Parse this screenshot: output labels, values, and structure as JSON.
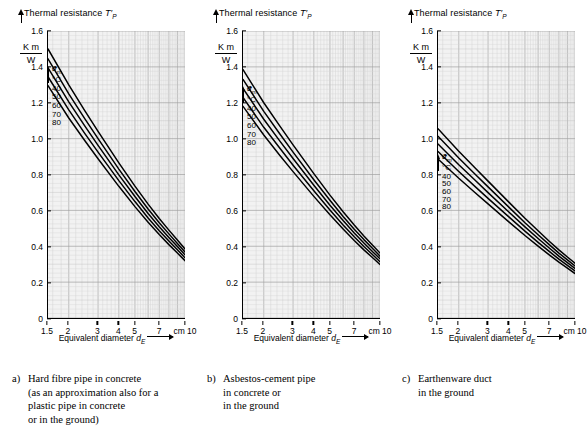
{
  "figure": {
    "axis_title": "Thermal resistance",
    "axis_symbol": "T",
    "axis_symbol_prime": "′",
    "axis_symbol_sub": "P",
    "y_unit_num": "K m",
    "y_unit_den": "W",
    "x_axis_title": "Equivalent diameter",
    "x_axis_symbol": "d",
    "x_axis_symbol_sub": "E",
    "legend_symbol": "ϑ",
    "legend_symbol_sub": "m",
    "legend_unit": "°C",
    "legend_levels": [
      "40",
      "50",
      "60",
      "70",
      "80"
    ]
  },
  "axes": {
    "y_ticks": [
      "0",
      "0.2",
      "0.4",
      "0.6",
      "0.8",
      "1.0",
      "1.2",
      "1.4",
      "1.6"
    ],
    "y_tick_values": [
      0,
      0.2,
      0.4,
      0.6,
      0.8,
      1.0,
      1.2,
      1.4,
      1.6
    ],
    "y_min": 0,
    "y_max": 1.6,
    "x_ticks": [
      "1.5",
      "2",
      "3",
      "4",
      "5",
      "7",
      "cm 10"
    ],
    "x_tick_values": [
      1.5,
      2,
      3,
      4,
      5,
      7,
      10
    ],
    "x_min": 1.5,
    "x_max": 10,
    "x_scale": "log",
    "x_unit": "cm",
    "grid": true
  },
  "panels": [
    {
      "id": "a",
      "marker": "a)",
      "caption_lines": [
        "Hard fibre pipe in concrete",
        "(as an approximation also for a",
        "plastic pipe in concrete",
        "or in the ground)"
      ]
    },
    {
      "id": "b",
      "marker": "b)",
      "caption_lines": [
        "Asbestos-cement pipe",
        "in concrete or",
        "in the ground"
      ]
    },
    {
      "id": "c",
      "marker": "c)",
      "caption_lines": [
        "Earthenware duct",
        "in the ground"
      ]
    }
  ],
  "chart_data": [
    {
      "type": "line",
      "panel": "a",
      "title": "Hard fibre pipe in concrete",
      "xlabel": "Equivalent diameter d_E (cm)",
      "ylabel": "Thermal resistance T'_P (K m / W)",
      "xscale": "log",
      "xlim": [
        1.5,
        10
      ],
      "ylim": [
        0,
        1.6
      ],
      "x": [
        1.5,
        2,
        2.5,
        3,
        4,
        5,
        6,
        7,
        8,
        9,
        10
      ],
      "series": [
        {
          "name": "40",
          "label": "ϑm = 40 °C",
          "values": [
            1.5,
            1.3,
            1.155,
            1.04,
            0.865,
            0.735,
            0.635,
            0.555,
            0.49,
            0.435,
            0.385
          ]
        },
        {
          "name": "50",
          "label": "ϑm = 50 °C",
          "values": [
            1.445,
            1.25,
            1.11,
            1.0,
            0.83,
            0.705,
            0.608,
            0.531,
            0.469,
            0.416,
            0.368
          ]
        },
        {
          "name": "60",
          "label": "ϑm = 60 °C",
          "values": [
            1.395,
            1.205,
            1.07,
            0.962,
            0.798,
            0.677,
            0.583,
            0.509,
            0.449,
            0.398,
            0.352
          ]
        },
        {
          "name": "70",
          "label": "ϑm = 70 °C",
          "values": [
            1.345,
            1.16,
            1.028,
            0.925,
            0.766,
            0.649,
            0.558,
            0.487,
            0.429,
            0.38,
            0.336
          ]
        },
        {
          "name": "80",
          "label": "ϑm = 80 °C",
          "values": [
            1.295,
            1.115,
            0.988,
            0.888,
            0.734,
            0.621,
            0.534,
            0.465,
            0.409,
            0.362,
            0.32
          ]
        }
      ]
    },
    {
      "type": "line",
      "panel": "b",
      "title": "Asbestos-cement pipe in concrete or in the ground",
      "xlabel": "Equivalent diameter d_E (cm)",
      "ylabel": "Thermal resistance T'_P (K m / W)",
      "xscale": "log",
      "xlim": [
        1.5,
        10
      ],
      "ylim": [
        0,
        1.6
      ],
      "x": [
        1.5,
        2,
        2.5,
        3,
        4,
        5,
        6,
        7,
        8,
        9,
        10
      ],
      "series": [
        {
          "name": "40",
          "label": "ϑm = 40 °C",
          "values": [
            1.385,
            1.2,
            1.07,
            0.965,
            0.805,
            0.685,
            0.592,
            0.518,
            0.457,
            0.407,
            0.362
          ]
        },
        {
          "name": "50",
          "label": "ϑm = 50 °C",
          "values": [
            1.33,
            1.152,
            1.026,
            0.925,
            0.771,
            0.656,
            0.566,
            0.495,
            0.437,
            0.389,
            0.345
          ]
        },
        {
          "name": "60",
          "label": "ϑm = 60 °C",
          "values": [
            1.28,
            1.108,
            0.986,
            0.889,
            0.74,
            0.629,
            0.543,
            0.474,
            0.418,
            0.371,
            0.33
          ]
        },
        {
          "name": "70",
          "label": "ϑm = 70 °C",
          "values": [
            1.23,
            1.063,
            0.946,
            0.852,
            0.709,
            0.602,
            0.519,
            0.453,
            0.399,
            0.354,
            0.314
          ]
        },
        {
          "name": "80",
          "label": "ϑm = 80 °C",
          "values": [
            1.18,
            1.02,
            0.906,
            0.816,
            0.678,
            0.575,
            0.496,
            0.432,
            0.38,
            0.337,
            0.298
          ]
        }
      ]
    },
    {
      "type": "line",
      "panel": "c",
      "title": "Earthenware duct in the ground",
      "xlabel": "Equivalent diameter d_E (cm)",
      "ylabel": "Thermal resistance T'_P (K m / W)",
      "xscale": "log",
      "xlim": [
        1.5,
        10
      ],
      "ylim": [
        0,
        1.6
      ],
      "x": [
        1.5,
        2,
        2.5,
        3,
        4,
        5,
        6,
        7,
        8,
        9,
        10
      ],
      "series": [
        {
          "name": "40",
          "label": "ϑm = 40 °C",
          "values": [
            1.055,
            0.93,
            0.838,
            0.763,
            0.646,
            0.556,
            0.486,
            0.428,
            0.38,
            0.34,
            0.305
          ]
        },
        {
          "name": "50",
          "label": "ϑm = 50 °C",
          "values": [
            1.013,
            0.892,
            0.803,
            0.731,
            0.618,
            0.531,
            0.464,
            0.409,
            0.362,
            0.324,
            0.29
          ]
        },
        {
          "name": "60",
          "label": "ϑm = 60 °C",
          "values": [
            0.97,
            0.854,
            0.769,
            0.699,
            0.591,
            0.508,
            0.443,
            0.39,
            0.345,
            0.309,
            0.276
          ]
        },
        {
          "name": "70",
          "label": "ϑm = 70 °C",
          "values": [
            0.928,
            0.817,
            0.734,
            0.667,
            0.564,
            0.484,
            0.422,
            0.371,
            0.328,
            0.293,
            0.262
          ]
        },
        {
          "name": "80",
          "label": "ϑm = 80 °C",
          "values": [
            0.886,
            0.779,
            0.7,
            0.636,
            0.536,
            0.46,
            0.401,
            0.352,
            0.311,
            0.278,
            0.248
          ]
        }
      ]
    }
  ]
}
